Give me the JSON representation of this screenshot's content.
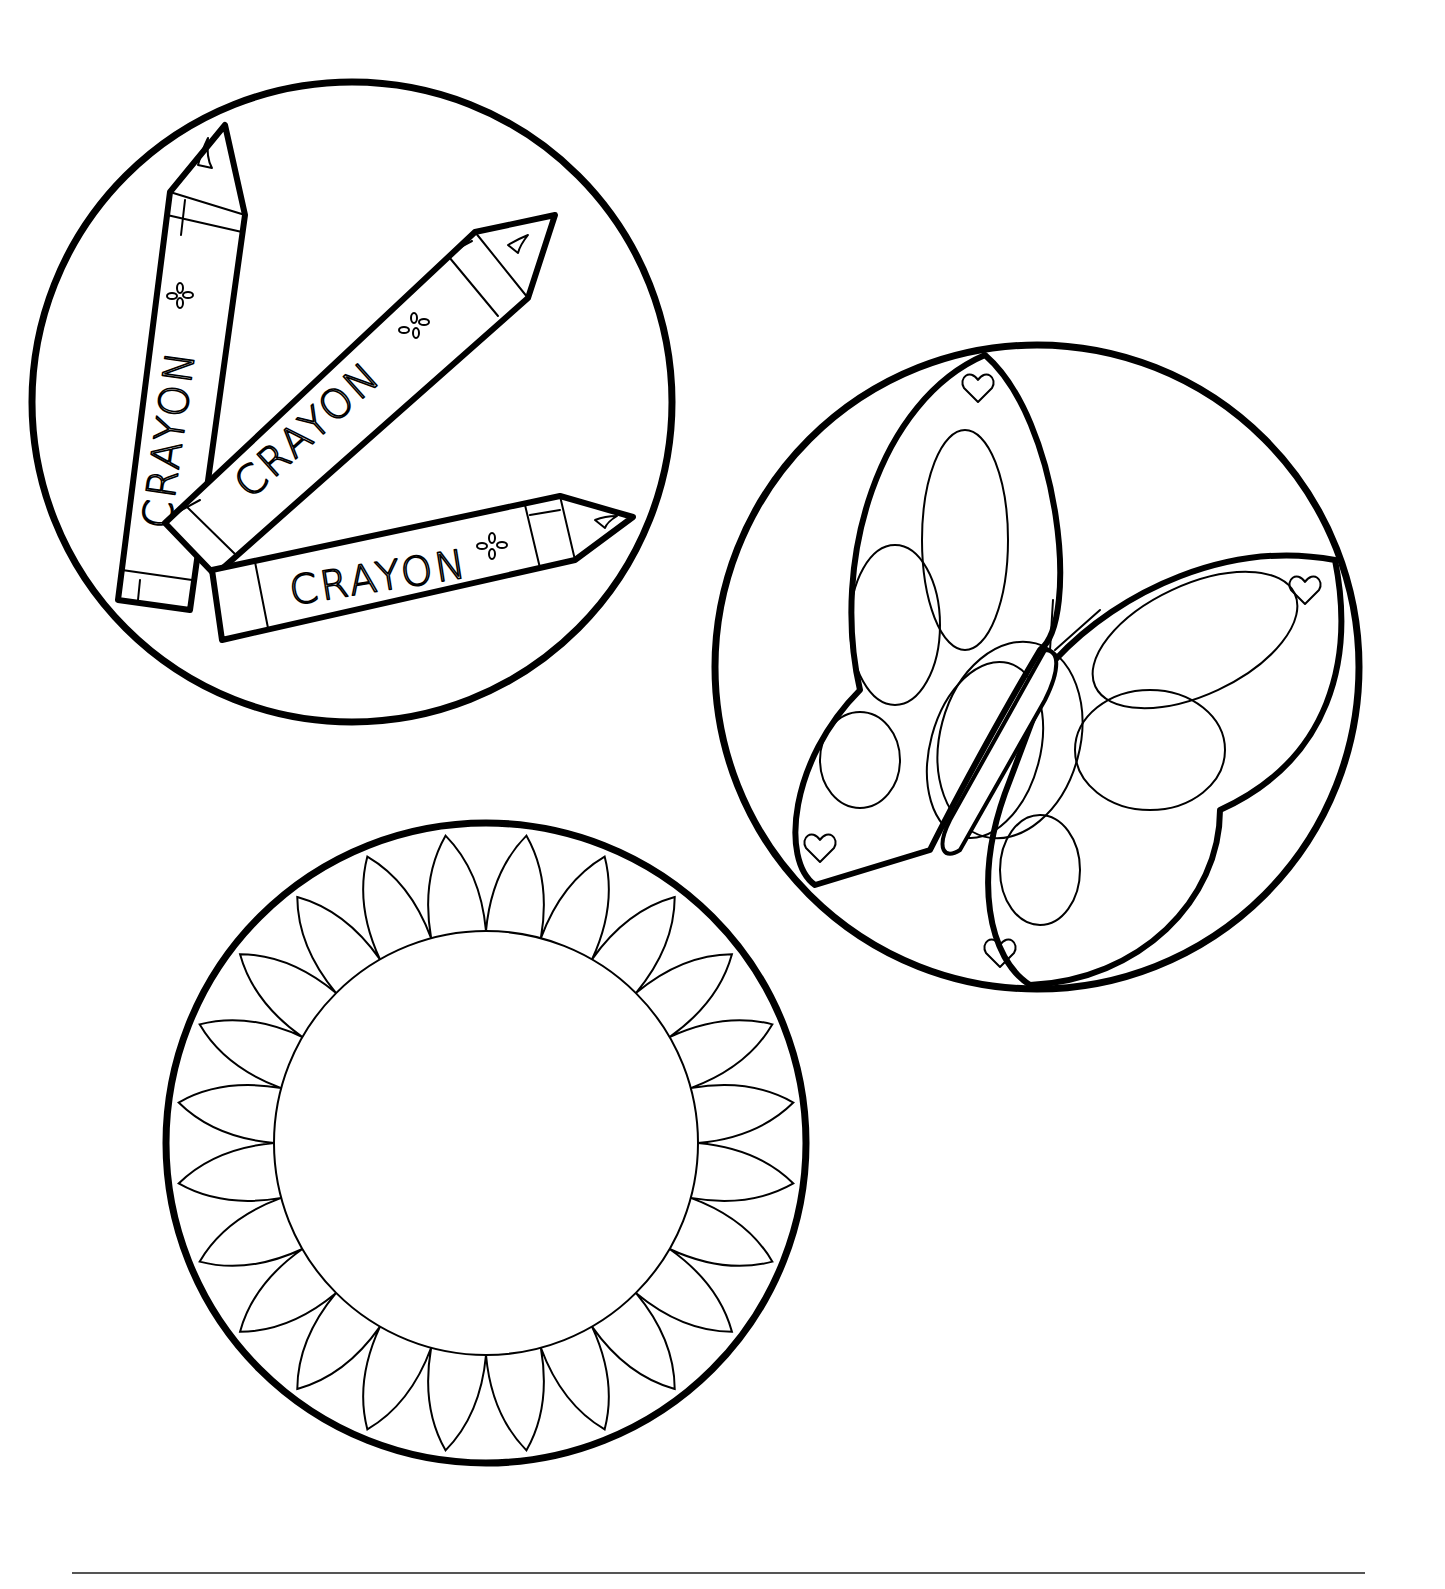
{
  "page": {
    "background": "#ffffff",
    "ink_color": "#000000"
  },
  "crayons_panel": {
    "crayons": [
      {
        "label": "CRAYON"
      },
      {
        "label": "CRAYON"
      },
      {
        "label": "CRAYON"
      }
    ]
  },
  "butterfly_panel": {
    "heart_count": 4
  },
  "sun_panel": {
    "petal_count": 24
  },
  "footer": {
    "rule": true
  }
}
